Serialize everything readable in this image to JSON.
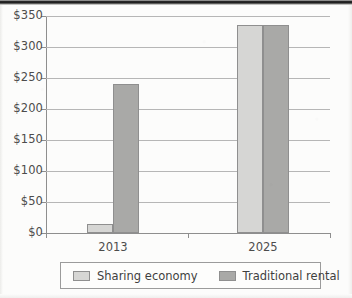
{
  "chart_data": {
    "type": "bar",
    "title": "",
    "xlabel": "",
    "ylabel": "",
    "categories": [
      "2013",
      "2025"
    ],
    "series": [
      {
        "name": "Sharing economy",
        "values": [
          15,
          335
        ],
        "color": "#d6d6d4"
      },
      {
        "name": "Traditional rental",
        "values": [
          240,
          335
        ],
        "color": "#a9a9a7"
      }
    ],
    "ylim": [
      0,
      350
    ],
    "ytick_values": [
      0,
      50,
      100,
      150,
      200,
      250,
      300,
      350
    ],
    "ytick_labels": [
      "$0",
      "$50",
      "$100",
      "$150",
      "$200",
      "$250",
      "$300",
      "$350"
    ],
    "grid": true,
    "legend_position": "bottom"
  },
  "legend": {
    "entries": [
      {
        "label": "Sharing economy",
        "swatch": "light-gray-swatch"
      },
      {
        "label": "Traditional rental",
        "swatch": "dark-gray-swatch"
      }
    ]
  }
}
